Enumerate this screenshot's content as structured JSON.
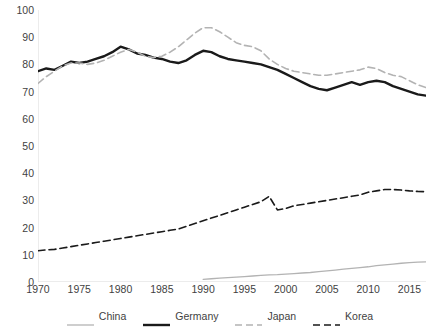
{
  "chart_data": {
    "type": "line",
    "title": "",
    "xlabel": "",
    "ylabel": "",
    "xlim": [
      1970,
      2017
    ],
    "ylim": [
      0,
      100
    ],
    "grid": false,
    "legend_position": "bottom",
    "x_ticks": [
      1970,
      1975,
      1980,
      1985,
      1990,
      1995,
      2000,
      2005,
      2010,
      2015
    ],
    "y_ticks": [
      0,
      10,
      20,
      30,
      40,
      50,
      60,
      70,
      80,
      90,
      100
    ],
    "x": [
      1970,
      1971,
      1972,
      1973,
      1974,
      1975,
      1976,
      1977,
      1978,
      1979,
      1980,
      1981,
      1982,
      1983,
      1984,
      1985,
      1986,
      1987,
      1988,
      1989,
      1990,
      1991,
      1992,
      1993,
      1994,
      1995,
      1996,
      1997,
      1998,
      1999,
      2000,
      2001,
      2002,
      2003,
      2004,
      2005,
      2006,
      2007,
      2008,
      2009,
      2010,
      2011,
      2012,
      2013,
      2014,
      2015,
      2016,
      2017
    ],
    "series": [
      {
        "name": "China",
        "color": "#b3b3b3",
        "style": "solid",
        "width": 1.3,
        "values": [
          null,
          null,
          null,
          null,
          null,
          null,
          null,
          null,
          null,
          null,
          null,
          null,
          null,
          null,
          null,
          null,
          null,
          null,
          null,
          null,
          1.0,
          1.2,
          1.4,
          1.6,
          1.8,
          2.0,
          2.2,
          2.4,
          2.6,
          2.7,
          2.9,
          3.1,
          3.3,
          3.5,
          3.8,
          4.1,
          4.4,
          4.7,
          5.0,
          5.3,
          5.6,
          6.0,
          6.3,
          6.6,
          6.9,
          7.1,
          7.3,
          7.4
        ]
      },
      {
        "name": "Germany",
        "color": "#1a1a1a",
        "style": "solid",
        "width": 2.4,
        "values": [
          77.5,
          78.5,
          78.0,
          79.5,
          81.0,
          80.5,
          81.0,
          82.0,
          83.0,
          84.5,
          86.5,
          85.5,
          84.0,
          83.5,
          82.5,
          82.0,
          81.0,
          80.5,
          81.5,
          83.5,
          85.0,
          84.5,
          83.0,
          82.0,
          81.5,
          81.0,
          80.5,
          80.0,
          79.0,
          78.0,
          76.5,
          75.0,
          73.5,
          72.0,
          71.0,
          70.5,
          71.5,
          72.5,
          73.5,
          72.5,
          73.5,
          74.0,
          73.5,
          72.0,
          71.0,
          70.0,
          69.0,
          68.5
        ]
      },
      {
        "name": "Japan",
        "color": "#b3b3b3",
        "style": "dashed",
        "width": 1.6,
        "values": [
          73.0,
          75.5,
          77.5,
          79.5,
          80.5,
          80.5,
          80.0,
          80.5,
          81.5,
          83.0,
          84.5,
          85.5,
          84.5,
          83.0,
          82.5,
          83.0,
          84.5,
          86.5,
          89.0,
          91.5,
          93.5,
          93.5,
          92.0,
          90.0,
          88.0,
          87.0,
          86.5,
          85.0,
          82.0,
          80.0,
          78.5,
          77.5,
          77.0,
          76.5,
          76.0,
          76.0,
          76.5,
          77.0,
          77.5,
          78.0,
          79.0,
          78.5,
          77.0,
          76.0,
          75.5,
          74.0,
          72.5,
          71.5
        ]
      },
      {
        "name": "Korea",
        "color": "#1a1a1a",
        "style": "dashed",
        "width": 1.6,
        "values": [
          11.5,
          11.8,
          12.0,
          12.5,
          13.0,
          13.5,
          14.0,
          14.5,
          15.0,
          15.5,
          16.0,
          16.5,
          17.0,
          17.5,
          18.0,
          18.5,
          19.0,
          19.5,
          20.5,
          21.5,
          22.5,
          23.5,
          24.5,
          25.5,
          26.5,
          27.5,
          28.5,
          29.5,
          31.5,
          26.5,
          27.0,
          28.0,
          28.5,
          29.0,
          29.5,
          30.0,
          30.5,
          31.0,
          31.5,
          32.0,
          33.0,
          33.5,
          34.0,
          34.0,
          33.8,
          33.5,
          33.3,
          33.2
        ]
      }
    ]
  },
  "legend": {
    "items": [
      {
        "label": "China"
      },
      {
        "label": "Germany"
      },
      {
        "label": "Japan"
      },
      {
        "label": "Korea"
      }
    ]
  }
}
